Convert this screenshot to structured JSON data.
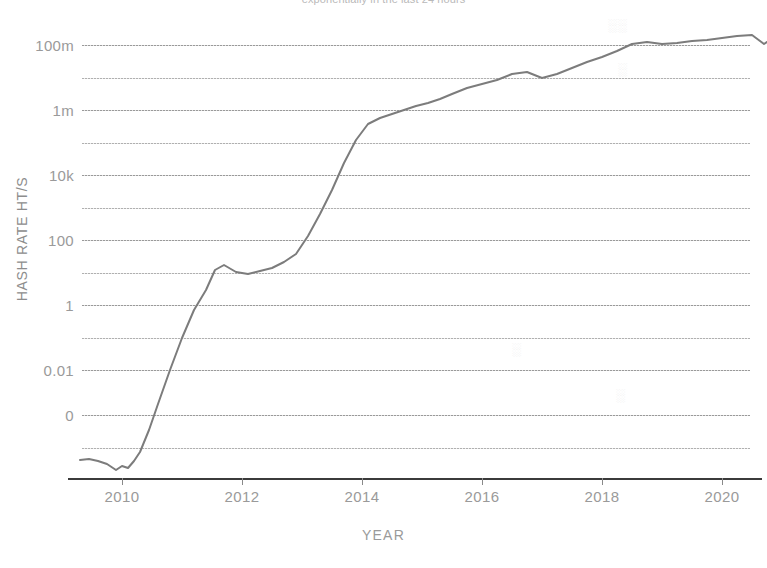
{
  "chart_data": {
    "type": "line",
    "title": "exponentially in the last 24 hours",
    "xlabel": "YEAR",
    "ylabel": "HASH RATE HT/S",
    "y_scale": "log",
    "grid": true,
    "legend": "none",
    "xlim": [
      2009.2,
      2021.0
    ],
    "ylim_labels": [
      "0",
      "0.01",
      "1",
      "100",
      "10k",
      "1m",
      "100m"
    ],
    "y_tick_labels": [
      "100m",
      "1m",
      "10k",
      "100",
      "1",
      "0.01",
      "0"
    ],
    "x_tick_labels": [
      "2010",
      "2012",
      "2014",
      "2016",
      "2018",
      "2020"
    ],
    "x_ticks": [
      2010,
      2012,
      2014,
      2016,
      2018,
      2020
    ],
    "minor_gridlines": 6,
    "series": [
      {
        "name": "Hash Rate",
        "color": "#7c7c7c",
        "x": [
          2009.3,
          2009.45,
          2009.6,
          2009.75,
          2009.9,
          2010.0,
          2010.1,
          2010.2,
          2010.3,
          2010.45,
          2010.6,
          2010.8,
          2011.0,
          2011.2,
          2011.4,
          2011.55,
          2011.7,
          2011.9,
          2012.1,
          2012.3,
          2012.5,
          2012.7,
          2012.9,
          2013.1,
          2013.3,
          2013.5,
          2013.7,
          2013.9,
          2014.1,
          2014.3,
          2014.5,
          2014.7,
          2014.9,
          2015.1,
          2015.3,
          2015.5,
          2015.75,
          2016.0,
          2016.25,
          2016.5,
          2016.75,
          2017.0,
          2017.25,
          2017.5,
          2017.75,
          2018.0,
          2018.25,
          2018.5,
          2018.75,
          2019.0,
          2019.25,
          2019.5,
          2019.75,
          2020.0,
          2020.25,
          2020.5,
          2020.7,
          2020.85
        ],
        "values_label": "log-scale hash rate (arbitrary decades below 0 baseline)",
        "y_pixels": [
          460,
          459,
          461,
          464,
          470,
          466,
          468,
          461,
          452,
          430,
          404,
          370,
          338,
          310,
          290,
          270,
          265,
          272,
          274,
          271,
          268,
          262,
          254,
          236,
          214,
          190,
          163,
          140,
          124,
          118,
          114,
          110,
          106,
          103,
          99,
          94,
          88,
          84,
          80,
          74,
          72,
          78,
          74,
          68,
          62,
          57,
          51,
          44,
          42,
          44,
          43,
          41,
          40,
          38,
          36,
          35,
          44,
          38
        ]
      }
    ],
    "annotations": []
  },
  "axis": {
    "y_title": "HASH RATE HT/S",
    "x_title": "YEAR",
    "y_ticks": [
      {
        "label": "100m",
        "y": 45
      },
      {
        "label": "1m",
        "y": 110
      },
      {
        "label": "10k",
        "y": 175
      },
      {
        "label": "100",
        "y": 240
      },
      {
        "label": "1",
        "y": 305
      },
      {
        "label": "0.01",
        "y": 370
      },
      {
        "label": "0",
        "y": 415
      }
    ],
    "y_minor": [
      78,
      143,
      208,
      273,
      338,
      448
    ],
    "x_ticks": [
      {
        "label": "2010",
        "x": 122
      },
      {
        "label": "2012",
        "x": 242
      },
      {
        "label": "2014",
        "x": 362
      },
      {
        "label": "2016",
        "x": 482
      },
      {
        "label": "2018",
        "x": 602
      },
      {
        "label": "2020",
        "x": 722
      }
    ]
  },
  "watermarks": [
    {
      "text": "░░",
      "x": 608,
      "y": 18
    },
    {
      "text": "░",
      "x": 618,
      "y": 62
    },
    {
      "text": "░",
      "x": 512,
      "y": 342
    },
    {
      "text": "░",
      "x": 616,
      "y": 388
    }
  ],
  "colors": {
    "background": "#ffffff",
    "line": "#7c7c7c",
    "grid": "#b0b0b0",
    "axis": "#3b3b3b",
    "text": "#9a9a9a"
  }
}
